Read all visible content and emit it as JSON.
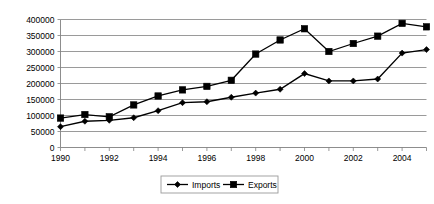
{
  "chart_data": {
    "type": "line",
    "title": "",
    "xlabel": "",
    "ylabel": "",
    "x": [
      1990,
      1991,
      1992,
      1993,
      1994,
      1995,
      1996,
      1997,
      1998,
      1999,
      2000,
      2001,
      2002,
      2003,
      2004,
      2005
    ],
    "series": [
      {
        "name": "Imports",
        "marker": "diamond",
        "color": "#000000",
        "values": [
          65000,
          82000,
          85000,
          93000,
          115000,
          140000,
          143000,
          157000,
          170000,
          182000,
          231000,
          208000,
          208000,
          214000,
          295000,
          306000
        ]
      },
      {
        "name": "Exports",
        "marker": "square",
        "color": "#000000",
        "values": [
          92000,
          103000,
          96000,
          133000,
          161000,
          180000,
          191000,
          210000,
          292000,
          336000,
          371000,
          300000,
          325000,
          348000,
          388000,
          377000
        ]
      }
    ],
    "ylim": [
      0,
      400000
    ],
    "yticks": [
      0,
      50000,
      100000,
      150000,
      200000,
      250000,
      300000,
      350000,
      400000
    ],
    "ytick_labels": [
      "0",
      "50000",
      "100000",
      "150000",
      "200000",
      "250000",
      "300000",
      "350000",
      "400000"
    ],
    "xtick_labels_shown": [
      "1990",
      "1992",
      "1994",
      "1996",
      "1998",
      "2000",
      "2002",
      "2004"
    ],
    "xlim": [
      1990,
      2005
    ],
    "grid": "horizontal",
    "legend_position": "bottom",
    "legend": [
      "Imports",
      "Exports"
    ],
    "gridline_color": "#808080",
    "background_color": "#ffffff"
  }
}
